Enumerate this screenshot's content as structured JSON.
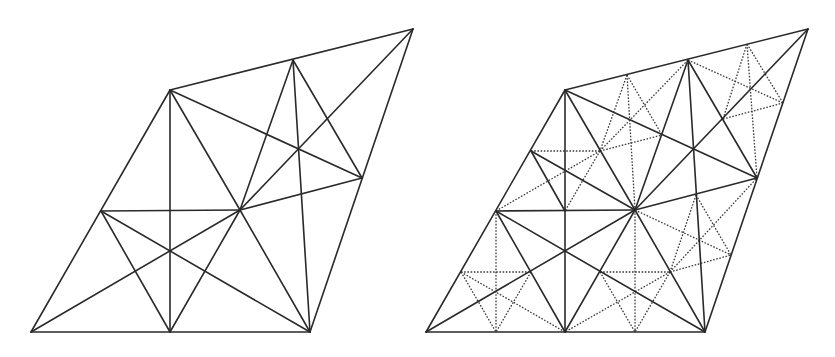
{
  "figure": {
    "stroke_color": "#2a2a2a",
    "background": "#ffffff"
  },
  "coarse_vertices": {
    "BL": [
      31,
      332
    ],
    "BM": [
      170,
      332
    ],
    "BR": [
      310,
      332
    ],
    "LM": [
      101,
      211
    ],
    "C": [
      240,
      210
    ],
    "RM": [
      362,
      178
    ],
    "TL": [
      170,
      90
    ],
    "TM": [
      293,
      60
    ],
    "TR": [
      413,
      29
    ]
  },
  "coarse_edges": [
    [
      "BL",
      "BR"
    ],
    [
      "BL",
      "TL"
    ],
    [
      "TL",
      "TR"
    ],
    [
      "BR",
      "TR"
    ],
    [
      "LM",
      "C"
    ],
    [
      "C",
      "RM"
    ],
    [
      "BM",
      "TL"
    ],
    [
      "TM",
      "BR"
    ],
    [
      "BL",
      "C"
    ],
    [
      "C",
      "TR"
    ],
    [
      "LM",
      "BR"
    ],
    [
      "TL",
      "RM"
    ],
    [
      "LM",
      "BM"
    ],
    [
      "BM",
      "C"
    ],
    [
      "C",
      "BR"
    ],
    [
      "TL",
      "C"
    ],
    [
      "C",
      "TM"
    ],
    [
      "TM",
      "RM"
    ]
  ],
  "panels": [
    {
      "name": "coarse-mesh",
      "offset_x": 0,
      "extra_solid": [],
      "dotted": []
    },
    {
      "name": "refined-mesh",
      "offset_x": 395,
      "extra_solid": [
        [
          [
            136,
            151
          ],
          [
            240,
            210
          ]
        ],
        [
          [
            136,
            151
          ],
          [
            170,
            211
          ]
        ]
      ],
      "dotted": [
        [
          [
            66,
            272
          ],
          [
            136,
            272
          ]
        ],
        [
          [
            101,
            211
          ],
          [
            101,
            332
          ]
        ],
        [
          [
            66,
            272
          ],
          [
            101,
            332
          ]
        ],
        [
          [
            136,
            272
          ],
          [
            101,
            332
          ]
        ],
        [
          [
            66,
            272
          ],
          [
            170,
            332
          ]
        ],
        [
          [
            205,
            272
          ],
          [
            275,
            272
          ]
        ],
        [
          [
            240,
            210
          ],
          [
            240,
            332
          ]
        ],
        [
          [
            205,
            272
          ],
          [
            240,
            332
          ]
        ],
        [
          [
            275,
            272
          ],
          [
            240,
            332
          ]
        ],
        [
          [
            275,
            272
          ],
          [
            170,
            332
          ]
        ],
        [
          [
            240,
            210
          ],
          [
            336,
            255
          ]
        ],
        [
          [
            301,
            195
          ],
          [
            275,
            272
          ]
        ],
        [
          [
            301,
            195
          ],
          [
            336,
            255
          ]
        ],
        [
          [
            275,
            272
          ],
          [
            362,
            178
          ]
        ],
        [
          [
            275,
            272
          ],
          [
            336,
            255
          ]
        ],
        [
          [
            136,
            151
          ],
          [
            205,
            151
          ]
        ],
        [
          [
            205,
            151
          ],
          [
            170,
            211
          ]
        ],
        [
          [
            101,
            211
          ],
          [
            205,
            151
          ]
        ],
        [
          [
            232,
            75
          ],
          [
            240,
            210
          ]
        ],
        [
          [
            232,
            75
          ],
          [
            205,
            151
          ]
        ],
        [
          [
            232,
            75
          ],
          [
            267,
            135
          ]
        ],
        [
          [
            205,
            151
          ],
          [
            267,
            135
          ]
        ],
        [
          [
            205,
            151
          ],
          [
            293,
            60
          ]
        ],
        [
          [
            352,
            44
          ],
          [
            362,
            178
          ]
        ],
        [
          [
            352,
            44
          ],
          [
            328,
            119
          ]
        ],
        [
          [
            352,
            44
          ],
          [
            388,
            103
          ]
        ],
        [
          [
            328,
            119
          ],
          [
            388,
            103
          ]
        ],
        [
          [
            293,
            60
          ],
          [
            388,
            103
          ]
        ]
      ]
    }
  ]
}
